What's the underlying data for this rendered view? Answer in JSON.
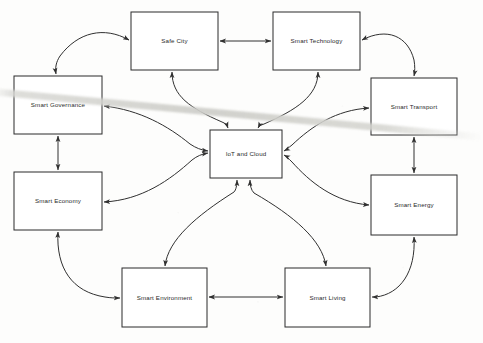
{
  "diagram": {
    "type": "node-link-diagram",
    "title": "",
    "background_color": "#fdfdfc",
    "node_fill": "#ffffff",
    "node_stroke": "#2b2b2b",
    "edge_color": "#303030",
    "artifact": {
      "name": "scanner-streak",
      "description": "diagonal light gray streak across middle of image",
      "color": "#d4d4cf"
    },
    "nodes": [
      {
        "id": "safe-city",
        "label": "Safe City",
        "x": 131,
        "y": 12,
        "w": 87,
        "h": 58
      },
      {
        "id": "smart-technology",
        "label": "Smart Technology",
        "x": 273,
        "y": 12,
        "w": 87,
        "h": 58
      },
      {
        "id": "smart-governance",
        "label": "Smart Governance",
        "x": 14,
        "y": 76,
        "w": 88,
        "h": 58
      },
      {
        "id": "smart-transport",
        "label": "Smart Transport",
        "x": 371,
        "y": 78,
        "w": 86,
        "h": 57
      },
      {
        "id": "iot-and-cloud",
        "label": "IoT and Cloud",
        "x": 210,
        "y": 130,
        "w": 72,
        "h": 48
      },
      {
        "id": "smart-economy",
        "label": "Smart Economy",
        "x": 14,
        "y": 172,
        "w": 88,
        "h": 58
      },
      {
        "id": "smart-energy",
        "label": "Smart Energy",
        "x": 371,
        "y": 175,
        "w": 86,
        "h": 60
      },
      {
        "id": "smart-environment",
        "label": "Smart Environment",
        "x": 122,
        "y": 268,
        "w": 85,
        "h": 59
      },
      {
        "id": "smart-living",
        "label": "Smart Living",
        "x": 285,
        "y": 268,
        "w": 85,
        "h": 59
      }
    ],
    "edges": [
      {
        "from": "safe-city",
        "to": "smart-technology",
        "style": "straight",
        "arrows": "both"
      },
      {
        "from": "safe-city",
        "to": "smart-governance",
        "style": "curved",
        "arrows": "both"
      },
      {
        "from": "smart-technology",
        "to": "smart-transport",
        "style": "curved",
        "arrows": "both"
      },
      {
        "from": "smart-governance",
        "to": "smart-economy",
        "style": "straight",
        "arrows": "both"
      },
      {
        "from": "smart-transport",
        "to": "smart-energy",
        "style": "straight",
        "arrows": "both"
      },
      {
        "from": "smart-economy",
        "to": "smart-environment",
        "style": "curved",
        "arrows": "both"
      },
      {
        "from": "smart-energy",
        "to": "smart-living",
        "style": "curved",
        "arrows": "both"
      },
      {
        "from": "smart-environment",
        "to": "smart-living",
        "style": "straight",
        "arrows": "both"
      },
      {
        "from": "safe-city",
        "to": "iot-and-cloud",
        "style": "curved",
        "arrows": "both"
      },
      {
        "from": "smart-technology",
        "to": "iot-and-cloud",
        "style": "curved",
        "arrows": "both"
      },
      {
        "from": "smart-governance",
        "to": "iot-and-cloud",
        "style": "curved",
        "arrows": "both"
      },
      {
        "from": "smart-transport",
        "to": "iot-and-cloud",
        "style": "curved",
        "arrows": "both"
      },
      {
        "from": "smart-economy",
        "to": "iot-and-cloud",
        "style": "curved",
        "arrows": "both"
      },
      {
        "from": "smart-energy",
        "to": "iot-and-cloud",
        "style": "curved",
        "arrows": "both"
      },
      {
        "from": "smart-environment",
        "to": "iot-and-cloud",
        "style": "curved",
        "arrows": "both"
      },
      {
        "from": "smart-living",
        "to": "iot-and-cloud",
        "style": "curved",
        "arrows": "both"
      }
    ]
  }
}
